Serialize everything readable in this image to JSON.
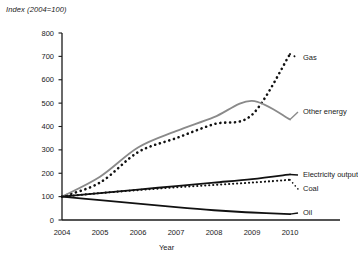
{
  "chart_data": {
    "type": "line",
    "title": "Index (2004=100)",
    "xlabel": "Year",
    "ylabel": "Index (2004=100)",
    "x": [
      2004,
      2005,
      2006,
      2007,
      2008,
      2009,
      2010
    ],
    "xtick_labels": [
      "2004",
      "2005",
      "2006",
      "2007",
      "2008",
      "2009",
      "2010"
    ],
    "ytick_labels": [
      "0",
      "100",
      "200",
      "300",
      "400",
      "500",
      "600",
      "700",
      "800"
    ],
    "yticks": [
      0,
      100,
      200,
      300,
      400,
      500,
      600,
      700,
      800
    ],
    "ylim": [
      0,
      800
    ],
    "xlim": [
      2004,
      2010
    ],
    "grid": false,
    "legend_position": "inline-right",
    "series": [
      {
        "name": "Gas",
        "label": "Gas",
        "style": "dotted",
        "color": "#111111",
        "width": 2.6,
        "values": [
          100,
          160,
          290,
          350,
          410,
          450,
          710
        ]
      },
      {
        "name": "Other energy",
        "label": "Other energy",
        "style": "solid",
        "color": "#8a8a8a",
        "width": 1.8,
        "values": [
          100,
          185,
          310,
          380,
          440,
          510,
          430
        ]
      },
      {
        "name": "Electricity output",
        "label": "Electricity output",
        "style": "solid",
        "color": "#111111",
        "width": 1.9,
        "values": [
          100,
          115,
          130,
          145,
          160,
          175,
          195
        ]
      },
      {
        "name": "Coal",
        "label": "Coal",
        "style": "dotted",
        "color": "#111111",
        "width": 2.1,
        "values": [
          100,
          115,
          128,
          140,
          150,
          160,
          172
        ]
      },
      {
        "name": "Oil",
        "label": "Oil",
        "style": "solid",
        "color": "#111111",
        "width": 1.9,
        "values": [
          100,
          85,
          70,
          55,
          42,
          32,
          25
        ]
      }
    ]
  },
  "axes": {
    "axis_color": "#1a1a1a",
    "plot_left": 62,
    "plot_right": 290,
    "plot_top": 33,
    "plot_bottom": 220
  }
}
